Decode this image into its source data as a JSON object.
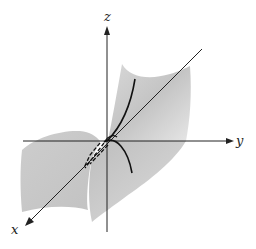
{
  "diagram": {
    "type": "3d-surface-plot",
    "axes": {
      "x": {
        "label": "x"
      },
      "y": {
        "label": "y"
      },
      "z": {
        "label": "z"
      }
    },
    "colors": {
      "surface": "#cfcfcf",
      "surface_dark": "#b8b8b8",
      "axis": "#222222",
      "curve": "#111111",
      "background": "#ffffff"
    }
  }
}
